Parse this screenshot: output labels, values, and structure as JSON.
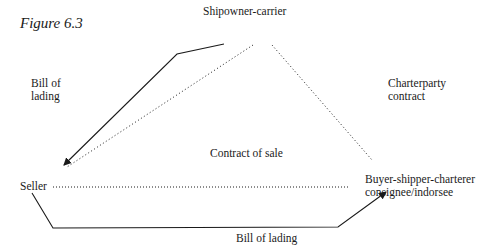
{
  "figure": {
    "title": "Figure 6.3"
  },
  "nodes": {
    "shipowner": "Shipowner-carrier",
    "seller": "Seller",
    "buyer_line1": "Buyer-shipper-charterer",
    "buyer_line2": "consignee/indorsee"
  },
  "edge_labels": {
    "bill_of_lading_left_line1": "Bill of",
    "bill_of_lading_left_line2": "lading",
    "charterparty_line1": "Charterparty",
    "charterparty_line2": "contract",
    "contract_of_sale": "Contract of sale",
    "bill_of_lading_bottom": "Bill of lading"
  },
  "edges": [
    {
      "from": "Shipowner-carrier",
      "to": "Seller",
      "style": "solid",
      "arrow": true,
      "label": "Bill of lading"
    },
    {
      "from": "Shipowner-carrier",
      "to": "Seller",
      "style": "dotted",
      "arrow": false
    },
    {
      "from": "Shipowner-carrier",
      "to": "Buyer-shipper-charterer",
      "style": "dotted",
      "arrow": false,
      "label": "Charterparty contract"
    },
    {
      "from": "Seller",
      "to": "Buyer-shipper-charterer",
      "style": "dotted",
      "arrow": false,
      "label": "Contract of sale"
    },
    {
      "from": "Seller",
      "to": "Buyer-shipper-charterer",
      "style": "solid",
      "arrow": true,
      "label": "Bill of lading"
    }
  ],
  "colors": {
    "ink": "#1a1a1a",
    "background": "#ffffff"
  }
}
